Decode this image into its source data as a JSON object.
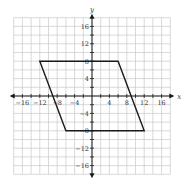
{
  "chart_data": {
    "type": "scatter",
    "title": "",
    "xlabel": "x",
    "ylabel": "y",
    "xlim": [
      -18,
      18
    ],
    "ylim": [
      -18,
      18
    ],
    "grid": true,
    "grid_step": 2,
    "x_ticks": [
      -16,
      -12,
      -8,
      -4,
      4,
      8,
      12,
      16
    ],
    "y_ticks": [
      16,
      12,
      8,
      4,
      -4,
      -8,
      -12,
      -16
    ],
    "x_tick_labels": [
      "−16",
      "−12",
      "−8",
      "−4",
      "4",
      "8",
      "12",
      "16"
    ],
    "y_tick_labels": [
      "16",
      "12",
      "8",
      "4",
      "−4",
      "−8",
      "−12",
      "−16"
    ],
    "shapes": [
      {
        "name": "parallelogram",
        "kind": "polygon",
        "vertices": [
          [
            -12,
            8
          ],
          [
            6,
            8
          ],
          [
            12,
            -8
          ],
          [
            -6,
            -8
          ]
        ],
        "stroke": "#1a1a1a",
        "fill": "none"
      }
    ]
  },
  "colors": {
    "grid": "#c8c8c8",
    "axis": "#1a1a1a",
    "shape": "#1a1a1a",
    "text": "#333333"
  }
}
